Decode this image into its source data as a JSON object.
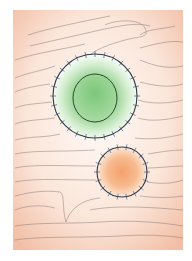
{
  "figure": {
    "panel": {
      "x": 13,
      "y": 10,
      "width": 170,
      "height": 240
    },
    "colors": {
      "tissue_light": "#fdf3ec",
      "tissue_dark": "#f3c3ac",
      "fiber_stroke": "#8a7a78",
      "membrane_stroke": "#2f3a4c",
      "spike_stroke": "#5a6f8c",
      "green_center": "#5cb85c",
      "green_edge": "#e8f5e4",
      "orange_center": "#f4a673",
      "orange_edge": "#fde5d4"
    },
    "large_cell": {
      "cx": 95,
      "cy": 96,
      "r": 42,
      "nucleus": {
        "cx": 95,
        "cy": 98,
        "rx": 22,
        "ry": 24
      },
      "spikes": 28
    },
    "small_cell": {
      "cx": 122,
      "cy": 172,
      "r": 25,
      "spikes": 18
    }
  }
}
